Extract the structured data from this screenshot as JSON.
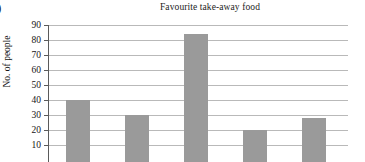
{
  "figure": {
    "question_marker": ")",
    "title": "Favourite take-away food"
  },
  "chart_data": {
    "type": "bar",
    "title": "Favourite take-away food",
    "xlabel": "",
    "ylabel": "No. of people",
    "categories": [
      "",
      "",
      "",
      "",
      ""
    ],
    "values": [
      40,
      30,
      84,
      20,
      28
    ],
    "ylim": [
      0,
      90
    ],
    "ytick_labels": [
      "90",
      "80",
      "70",
      "60",
      "50",
      "40",
      "30",
      "20",
      "10"
    ],
    "ytick_values": [
      90,
      80,
      70,
      60,
      50,
      40,
      30,
      20,
      10
    ],
    "grid": true,
    "legend": "none",
    "bar_color": "#9a9a9a",
    "gridline_color": "#b9b9b9",
    "axis_color": "#5a5a5a",
    "note": "Image is cropped below the 10 gridline; x-axis category labels are not visible."
  }
}
